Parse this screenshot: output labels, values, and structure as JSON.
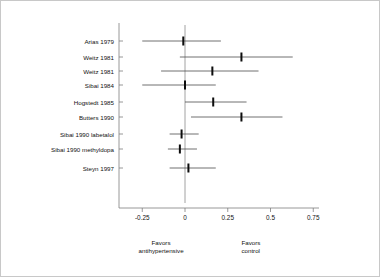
{
  "chart_data": {
    "type": "scatter",
    "plot_kind": "forest-plot",
    "title": "",
    "subtitle": "",
    "xlabel": "",
    "ylabel": "",
    "xlim": [
      -0.37,
      0.8
    ],
    "xticks": [
      -0.25,
      0,
      0.25,
      0.5,
      0.75
    ],
    "xtick_labels": [
      "-0.25",
      "0",
      "0.25",
      "0.5",
      "0.75"
    ],
    "grid": false,
    "legend": null,
    "reference_line": 0,
    "categories": [
      "Arias 1979",
      "Weitz 1981",
      "Weitz 1981",
      "Sibai 1984",
      "Hogstedt 1985",
      "Butters 1990",
      "Sibai 1990 labetalol",
      "Sibai 1990 methyldopa",
      "Steyn 1997"
    ],
    "points": [
      {
        "label": "Arias 1979",
        "estimate": -0.01,
        "ci_low": -0.25,
        "ci_high": 0.21
      },
      {
        "label": "Weitz 1981",
        "estimate": 0.33,
        "ci_low": -0.03,
        "ci_high": 0.63
      },
      {
        "label": "Weitz 1981",
        "estimate": 0.16,
        "ci_low": -0.14,
        "ci_high": 0.43
      },
      {
        "label": "Sibai 1984",
        "estimate": 0.0,
        "ci_low": -0.25,
        "ci_high": 0.18
      },
      {
        "label": "Hogstedt 1985",
        "estimate": 0.165,
        "ci_low": 0.0,
        "ci_high": 0.36
      },
      {
        "label": "Butters 1990",
        "estimate": 0.33,
        "ci_low": 0.035,
        "ci_high": 0.57
      },
      {
        "label": "Sibai 1990 labetalol",
        "estimate": -0.02,
        "ci_low": -0.09,
        "ci_high": 0.08
      },
      {
        "label": "Sibai 1990 methyldopa",
        "estimate": -0.03,
        "ci_low": -0.1,
        "ci_high": 0.07
      },
      {
        "label": "Steyn 1997",
        "estimate": 0.02,
        "ci_low": -0.09,
        "ci_high": 0.18
      }
    ],
    "annotations": [
      {
        "name": "favors-left",
        "text": "Favors\nantihypertensive",
        "at": -0.14
      },
      {
        "name": "favors-right",
        "text": "Favors\ncontrol",
        "at": 0.33
      }
    ],
    "colors": {
      "marker": "#0d0d0d",
      "ci_line": "#4d4d4d",
      "axis": "#7d7d7d",
      "zero_line": "#8a8a8a",
      "background": "#ffffff",
      "frame": "#c8c8c8"
    }
  },
  "footer": {
    "left_line1": "Favors",
    "left_line2": "antihypertensive",
    "right_line1": "Favors",
    "right_line2": "control"
  },
  "axis": {
    "tick_labels": [
      "-0.25",
      "0",
      "0.25",
      "0.5",
      "0.75"
    ]
  },
  "studies": [
    "Arias 1979",
    "Weitz 1981",
    "Weitz 1981",
    "Sibai 1984",
    "Hogstedt 1985",
    "Butters 1990",
    "Sibai 1990 labetalol",
    "Sibai 1990 methyldopa",
    "Steyn 1997"
  ]
}
